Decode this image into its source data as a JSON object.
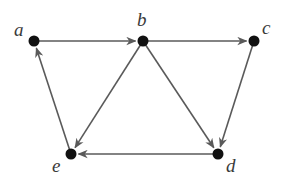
{
  "diagram": {
    "type": "directed-graph",
    "colors": {
      "edge": "#5a5a5a",
      "node": "#111111",
      "label": "#3a3a3a",
      "background": "#ffffff"
    },
    "nodes": [
      {
        "id": "a",
        "label": "a",
        "x": 34,
        "y": 41,
        "lx": 14,
        "ly": 36
      },
      {
        "id": "b",
        "label": "b",
        "x": 143,
        "y": 41,
        "lx": 137,
        "ly": 26
      },
      {
        "id": "c",
        "label": "c",
        "x": 254,
        "y": 41,
        "lx": 262,
        "ly": 34
      },
      {
        "id": "d",
        "label": "d",
        "x": 218,
        "y": 154,
        "lx": 226,
        "ly": 172
      },
      {
        "id": "e",
        "label": "e",
        "x": 71,
        "y": 154,
        "lx": 52,
        "ly": 172
      }
    ],
    "edges": [
      {
        "from": "a",
        "to": "b"
      },
      {
        "from": "b",
        "to": "c"
      },
      {
        "from": "b",
        "to": "e"
      },
      {
        "from": "b",
        "to": "d"
      },
      {
        "from": "c",
        "to": "d"
      },
      {
        "from": "d",
        "to": "e"
      },
      {
        "from": "e",
        "to": "a"
      }
    ]
  }
}
